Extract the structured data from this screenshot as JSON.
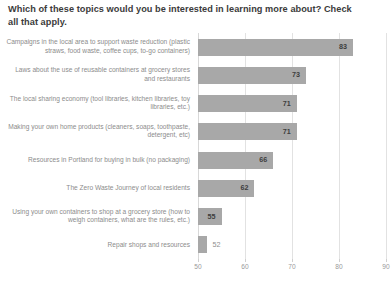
{
  "chart_data": {
    "type": "bar",
    "orientation": "horizontal",
    "title": "Which of these topics would you be interested in learning more about? Check all that apply.",
    "xlabel": "",
    "ylabel": "",
    "xlim": [
      50,
      90
    ],
    "xticks": [
      50,
      60,
      70,
      80,
      90
    ],
    "xtick_labels": [
      "50",
      "60",
      "70",
      "80",
      "90"
    ],
    "grid": true,
    "legend": false,
    "bar_color": "#a8a8a8",
    "categories": [
      "Campaigns in the local area to support waste reduction (plastic straws, food waste, coffee cups, to-go containers)",
      "Laws about the use of reusable containers at grocery stores and restaurants",
      "The local sharing economy (tool libraries, kitchen libraries, toy libraries, etc.)",
      "Making your own home products (cleaners, soaps, toothpaste, detergent, etc)",
      "Resources in Portland for buying in bulk (no packaging)",
      "The Zero Waste Journey of local residents",
      "Using your own containers to shop at a grocery store (how to weigh containers, what are the rules, etc.)",
      "Repair shops and resources"
    ],
    "values": [
      83,
      73,
      71,
      71,
      66,
      62,
      55,
      52
    ],
    "value_labels": [
      "83",
      "73",
      "71",
      "71",
      "66",
      "62",
      "55",
      "52"
    ]
  }
}
